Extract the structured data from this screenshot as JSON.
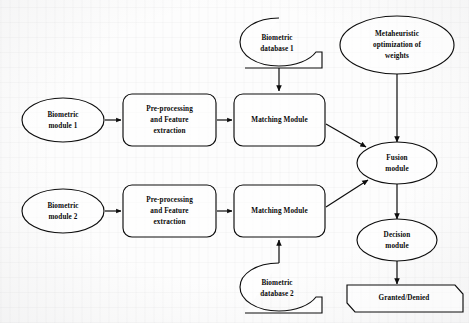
{
  "diagram": {
    "background_color": "#fdfdfd",
    "stroke_color": "#0d0d0d",
    "text_color": "#0a0a0a",
    "nodes": [
      {
        "id": "biometric_module_1",
        "shape": "ellipse",
        "label": "Biometric\nmodule 1",
        "line1": "Biometric",
        "line2": "module 1",
        "line3": ""
      },
      {
        "id": "preprocess_1",
        "shape": "rounded-rect",
        "label": "Pre-processing and Feature extraction",
        "line1": "Pre-processing",
        "line2": "and Feature",
        "line3": "extraction"
      },
      {
        "id": "matching_module_1",
        "shape": "rounded-rect",
        "label": "Matching Module",
        "line1": "Matching Module",
        "line2": "",
        "line3": ""
      },
      {
        "id": "biometric_database_1",
        "shape": "database-callout",
        "label": "Biometric database 1",
        "line1": "Biometric",
        "line2": "database 1",
        "line3": ""
      },
      {
        "id": "metaheuristic",
        "shape": "ellipse",
        "label": "Metaheuristic optimization of weights",
        "line1": "Metaheuristic",
        "line2": "optimization of",
        "line3": "weights"
      },
      {
        "id": "fusion_module",
        "shape": "ellipse",
        "label": "Fusion module",
        "line1": "Fusion",
        "line2": "module",
        "line3": ""
      },
      {
        "id": "biometric_module_2",
        "shape": "ellipse",
        "label": "Biometric module 2",
        "line1": "Biometric",
        "line2": "module 2",
        "line3": ""
      },
      {
        "id": "preprocess_2",
        "shape": "rounded-rect",
        "label": "Pre-processing and Feature extraction",
        "line1": "Pre-processing",
        "line2": "and Feature",
        "line3": "extraction"
      },
      {
        "id": "matching_module_2",
        "shape": "rounded-rect",
        "label": "Matching Module",
        "line1": "Matching Module",
        "line2": "",
        "line3": ""
      },
      {
        "id": "biometric_database_2",
        "shape": "database-callout",
        "label": "Biometric database 2",
        "line1": "Biometric",
        "line2": "database 2",
        "line3": ""
      },
      {
        "id": "decision_module",
        "shape": "ellipse",
        "label": "Decision module",
        "line1": "Decision",
        "line2": "module",
        "line3": ""
      },
      {
        "id": "result",
        "shape": "hexagon",
        "label": "Granted/Denied",
        "line1": "Granted/Denied",
        "line2": "",
        "line3": ""
      }
    ],
    "edges": [
      {
        "from": "biometric_module_1",
        "to": "preprocess_1",
        "style": "arrow"
      },
      {
        "from": "preprocess_1",
        "to": "matching_module_1",
        "style": "arrow"
      },
      {
        "from": "biometric_database_1",
        "to": "matching_module_1",
        "style": "arrow"
      },
      {
        "from": "matching_module_1",
        "to": "fusion_module",
        "style": "arrow"
      },
      {
        "from": "metaheuristic",
        "to": "fusion_module",
        "style": "arrow"
      },
      {
        "from": "biometric_module_2",
        "to": "preprocess_2",
        "style": "arrow"
      },
      {
        "from": "preprocess_2",
        "to": "matching_module_2",
        "style": "arrow"
      },
      {
        "from": "biometric_database_2",
        "to": "matching_module_2",
        "style": "arrow"
      },
      {
        "from": "matching_module_2",
        "to": "fusion_module",
        "style": "arrow"
      },
      {
        "from": "fusion_module",
        "to": "decision_module",
        "style": "arrow"
      },
      {
        "from": "decision_module",
        "to": "result",
        "style": "arrow"
      }
    ]
  }
}
